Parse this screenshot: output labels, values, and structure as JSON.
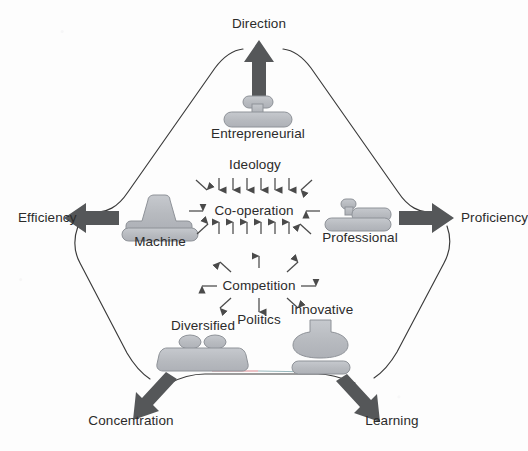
{
  "diagram": {
    "background_color": "#fdfdfd",
    "outline_color": "#3a3a3a",
    "shape_fill": "#b9bcc1",
    "shape_stroke": "#8e9298",
    "arrow_color": "#555759",
    "small_arrow_color": "#4a4a4a",
    "text_color": "#2b2b2b"
  },
  "forms": [
    {
      "id": "entrepreneurial",
      "label": "Entrepreneurial",
      "position": "top"
    },
    {
      "id": "machine",
      "label": "Machine",
      "position": "left"
    },
    {
      "id": "professional",
      "label": "Professional",
      "position": "right"
    },
    {
      "id": "diversified",
      "label": "Diversified",
      "position": "bottom-left"
    },
    {
      "id": "innovative",
      "label": "Innovative",
      "position": "bottom-right"
    }
  ],
  "outcomes": [
    {
      "id": "direction",
      "label": "Direction",
      "arrow": "up",
      "from": "entrepreneurial"
    },
    {
      "id": "efficiency",
      "label": "Efficiency",
      "arrow": "left",
      "from": "machine"
    },
    {
      "id": "proficiency",
      "label": "Proficiency",
      "arrow": "right",
      "from": "professional"
    },
    {
      "id": "concentration",
      "label": "Concentration",
      "arrow": "down-left",
      "from": "diversified"
    },
    {
      "id": "learning",
      "label": "Learning",
      "arrow": "down-right",
      "from": "innovative"
    }
  ],
  "forces": [
    {
      "id": "ideology",
      "label": "Ideology",
      "kind": "converging",
      "note": "arrows point inward toward Co-operation"
    },
    {
      "id": "cooperation",
      "label": "Co-operation",
      "kind": "center-converging"
    },
    {
      "id": "competition",
      "label": "Competition",
      "kind": "center-diverging"
    },
    {
      "id": "politics",
      "label": "Politics",
      "kind": "diverging",
      "note": "arrows radiate outward from Competition"
    }
  ]
}
